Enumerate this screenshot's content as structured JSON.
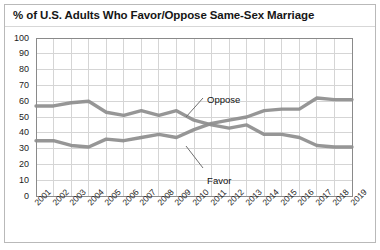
{
  "chart_data": {
    "type": "line",
    "title": "% of U.S. Adults Who Favor/Oppose Same-Sex Marriage",
    "xlabel": "",
    "ylabel": "",
    "ylim": [
      0,
      100
    ],
    "ytick_step": 10,
    "yticks": [
      "100",
      "90",
      "80",
      "70",
      "60",
      "50",
      "40",
      "30",
      "20",
      "10",
      "0"
    ],
    "grid": true,
    "legend_position": "inline-annotations",
    "categories": [
      "2001",
      "2002",
      "2003",
      "2004",
      "2005",
      "2006",
      "2007",
      "2008",
      "2009",
      "2010",
      "2011",
      "2012",
      "2013",
      "2014",
      "2015",
      "2016",
      "2017",
      "2018",
      "2019"
    ],
    "series": [
      {
        "name": "Oppose",
        "color": "#8d8d8d",
        "values": [
          57,
          57,
          59,
          60,
          53,
          51,
          54,
          51,
          54,
          48,
          45,
          43,
          45,
          39,
          39,
          37,
          32,
          31,
          31
        ]
      },
      {
        "name": "Favor",
        "color": "#8d8d8d",
        "values": [
          35,
          35,
          32,
          31,
          36,
          35,
          37,
          39,
          37,
          42,
          46,
          48,
          50,
          54,
          55,
          55,
          62,
          61,
          61
        ]
      }
    ],
    "annotations": [
      {
        "text": "Oppose",
        "x_pct": 54.5,
        "y_pct": 37.5
      },
      {
        "text": "Favor",
        "x_pct": 54.5,
        "y_pct": 70.0
      }
    ]
  },
  "colors": {
    "line": "#8d8d8d",
    "grid": "#d5d5d5",
    "axis": "#8a8a8a",
    "border": "#b9b9b9",
    "text": "#1c1c1c"
  }
}
